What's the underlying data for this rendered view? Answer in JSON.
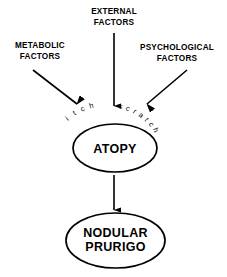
{
  "diagram": {
    "background_color": "#ffffff",
    "stroke_color": "#000000",
    "factors": [
      {
        "id": "external",
        "line1": "EXTERNAL",
        "line2": "FACTORS",
        "x": 114,
        "y1": 14,
        "y2": 25,
        "arrow": {
          "x1": 114,
          "y1": 33,
          "x2": 114,
          "y2": 106
        }
      },
      {
        "id": "metabolic",
        "line1": "METABOLIC",
        "line2": "FACTORS",
        "x": 40,
        "y1": 48,
        "y2": 59,
        "arrow": {
          "x1": 33,
          "y1": 70,
          "x2": 77,
          "y2": 104
        }
      },
      {
        "id": "psychological",
        "line1": "PSYCHOLOGICAL",
        "line2": "FACTORS",
        "x": 177,
        "y1": 50,
        "y2": 61,
        "arrow": {
          "x1": 187,
          "y1": 70,
          "x2": 147,
          "y2": 104
        }
      }
    ],
    "cycle_text": {
      "itch": {
        "word": "itch",
        "letters": [
          {
            "char": "i",
            "x": 68.5,
            "y": 120.5,
            "rotate": -42
          },
          {
            "char": "t",
            "x": 75.5,
            "y": 115.0,
            "rotate": -33
          },
          {
            "char": "c",
            "x": 83.5,
            "y": 111.0,
            "rotate": -24
          },
          {
            "char": "h",
            "x": 92.0,
            "y": 108.0,
            "rotate": -16
          }
        ]
      },
      "scratch": {
        "word": "scratch",
        "letters": [
          {
            "char": "s",
            "x": 120.0,
            "y": 108.5,
            "rotate": 16
          },
          {
            "char": "c",
            "x": 127.0,
            "y": 110.5,
            "rotate": 24
          },
          {
            "char": "r",
            "x": 133.5,
            "y": 113.5,
            "rotate": 33
          },
          {
            "char": "a",
            "x": 139.5,
            "y": 117.0,
            "rotate": 42
          },
          {
            "char": "t",
            "x": 145.0,
            "y": 121.0,
            "rotate": 51
          },
          {
            "char": "c",
            "x": 149.5,
            "y": 125.5,
            "rotate": 60
          },
          {
            "char": "h",
            "x": 153.5,
            "y": 131.0,
            "rotate": 69
          }
        ]
      }
    },
    "nodes": [
      {
        "id": "atopy",
        "label_line1": "ATOPY",
        "label_line2": "",
        "cx": 115,
        "cy": 148,
        "rx": 42,
        "ry": 24,
        "text_y1": 152.5
      },
      {
        "id": "nodular-prurigo",
        "label_line1": "NODULAR",
        "label_line2": "PRURIGO",
        "cx": 115.5,
        "cy": 240.5,
        "rx": 49.5,
        "ry": 27.5,
        "text_y1": 237,
        "text_y2": 251
      }
    ],
    "connector": {
      "id": "atopy-to-prurigo",
      "x1": 114,
      "y1": 175,
      "x2": 114,
      "y2": 210
    }
  }
}
